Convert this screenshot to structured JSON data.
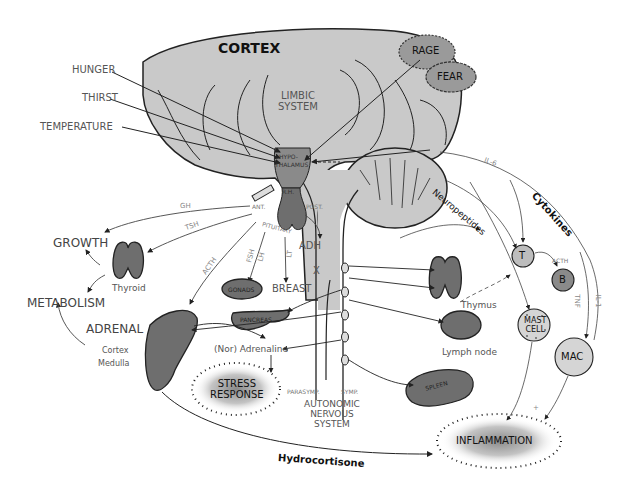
{
  "diagram": {
    "colors": {
      "brain": "#c9c9c9",
      "organ": "#6e6e6e",
      "limbic_emotion": "#9a9a9a",
      "cell_light": "#bdbdbd",
      "outline": "#222222",
      "label": "#555555"
    },
    "brain": {
      "cortex": "CORTEX",
      "limbic_line1": "LIMBIC",
      "limbic_line2": "SYSTEM",
      "rage": "RAGE",
      "fear": "FEAR",
      "hypothalamus_line1": "HYPO-",
      "hypothalamus_line2": "THALAMUS",
      "rh": "R.H.",
      "pituitary": "PITUITARY",
      "ant": "ANT.",
      "post": "POST."
    },
    "inputs": [
      "HUNGER",
      "THIRST",
      "TEMPERATURE"
    ],
    "hormones": {
      "gh": "GH",
      "tsh": "TSH",
      "acth": "ACTH",
      "fsh": "FSH",
      "lh": "LH",
      "lt": "LT",
      "adh": "ADH",
      "x": "X",
      "il6": "IL-6",
      "acth_b": "ACTH",
      "tnf": "TNF",
      "il1": "IL-1",
      "plus": "+"
    },
    "targets": {
      "growth": "GROWTH",
      "metabolism": "METABOLISM",
      "thyroid": "Thyroid",
      "adrenal": "ADRENAL",
      "cortex": "Cortex",
      "medulla": "Medulla",
      "gonads": "GONADS",
      "breast": "BREAST",
      "pancreas": "PANCREAS",
      "noradrenaline": "(Nor) Adrenaline",
      "stress_line1": "STRESS",
      "stress_line2": "RESPONSE",
      "thymus": "Thymus",
      "lymph_node": "Lymph node",
      "spleen": "SPLEEN",
      "inflammation": "INFLAMMATION",
      "hydrocortisone": "Hydrocortisone"
    },
    "ans": {
      "parasymp": "PARASYMP.",
      "symp": "SYMP.",
      "line1": "AUTONOMIC",
      "line2": "NERVOUS",
      "line3": "SYSTEM"
    },
    "immune": {
      "neuropeptides": "Neuropeptides",
      "cytokines": "Cytokines",
      "t_cell": "T",
      "b_cell": "B",
      "mast_line1": "MAST",
      "mast_line2": "CELL",
      "mac": "MAC"
    }
  }
}
